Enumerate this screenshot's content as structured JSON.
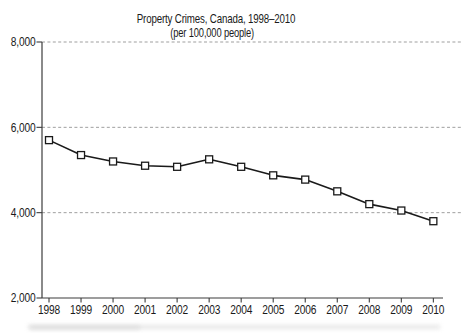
{
  "chart_data": {
    "type": "line",
    "title": "Property Crimes, Canada, 1998–2010",
    "subtitle": "(per 100,000 people)",
    "x": [
      1998,
      1999,
      2000,
      2001,
      2002,
      2003,
      2004,
      2005,
      2006,
      2007,
      2008,
      2009,
      2010
    ],
    "x_tick_labels": [
      "1998",
      "1999",
      "2000",
      "2001",
      "2002",
      "2003",
      "2004",
      "2005",
      "2006",
      "2007",
      "2008",
      "2009",
      "2010"
    ],
    "series": [
      {
        "name": "Property crime rate per 100,000 people",
        "values": [
          5700,
          5350,
          5200,
          5100,
          5075,
          5250,
          5075,
          4875,
          4775,
          4500,
          4200,
          4050,
          3800
        ]
      }
    ],
    "ylim": [
      2000,
      8000
    ],
    "yticks": [
      2000,
      4000,
      6000,
      8000
    ],
    "ytick_labels": [
      "2,000",
      "4,000",
      "6,000",
      "8,000"
    ],
    "gridlines": {
      "style": "dashed",
      "orientation": "horizontal",
      "levels": [
        4000,
        6000,
        8000
      ]
    },
    "legend": "none",
    "marker": "open-square",
    "colors": {
      "line": "#1a1a1a",
      "marker_fill": "#ffffff",
      "marker_stroke": "#1a1a1a",
      "axis": "#3c3c3c",
      "gridline": "#9f9f9f",
      "text": "#1a1a1a",
      "background": "#ffffff"
    }
  }
}
